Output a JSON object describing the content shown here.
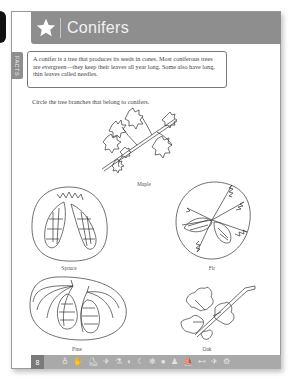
{
  "header": {
    "title": "Conifers",
    "icon": "star-icon",
    "background_color": "#8e8e8e"
  },
  "facts": {
    "tab_label": "FACTS",
    "text": "A conifer is a tree that produces its seeds in cones. Most coniferous trees are evergreen—they keep their leaves all year long. Some also have long, thin leaves called needles."
  },
  "instruction": "Circle the tree branches that belong to conifers.",
  "figures": [
    {
      "name": "Maple",
      "circled": false,
      "icon": "maple-branch-icon"
    },
    {
      "name": "Spruce",
      "circled": true,
      "icon": "spruce-cones-icon"
    },
    {
      "name": "Fir",
      "circled": true,
      "icon": "fir-branch-icon"
    },
    {
      "name": "Pine",
      "circled": true,
      "icon": "pine-cones-icon"
    },
    {
      "name": "Oak",
      "circled": false,
      "icon": "oak-branch-icon"
    }
  ],
  "footer": {
    "page_number": "8",
    "icons": [
      "bottle-icon",
      "hand-icon",
      "shoe-icon",
      "plane-icon",
      "microscope-icon",
      "fish-icon",
      "moon-icon",
      "butterfly-icon",
      "ball-icon",
      "figure-icon",
      "ship-icon",
      "car-icon",
      "airplane-icon",
      "bicycle-icon"
    ],
    "icon_glyphs": [
      "♁",
      "✋",
      "⛸",
      "✈",
      "⚗",
      "◐",
      "☾",
      "✻",
      "●",
      "♟",
      "⛵",
      "⊷",
      "✈",
      "⚙"
    ]
  }
}
